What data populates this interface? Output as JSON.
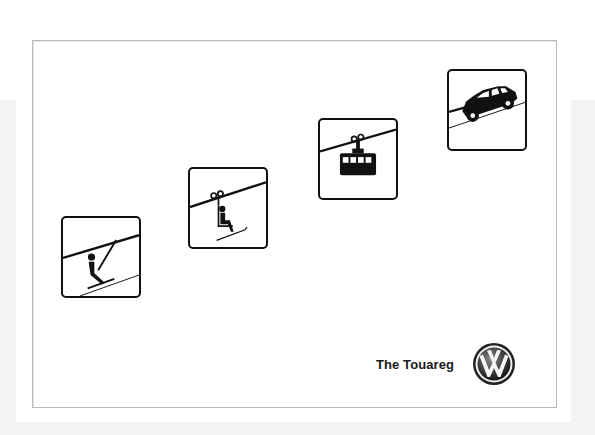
{
  "ad": {
    "tagline": "The Touareg",
    "brand_logo": "volkswagen-logo",
    "colors": {
      "background": "#ffffff",
      "outer_band": "#f3f3f3",
      "frame_border": "#b9b9b9",
      "ink": "#111111"
    },
    "signs": [
      {
        "id": "surface-lift",
        "icon": "t-bar-surface-lift-icon"
      },
      {
        "id": "chairlift",
        "icon": "chairlift-icon"
      },
      {
        "id": "gondola",
        "icon": "gondola-cable-car-icon"
      },
      {
        "id": "suv-hill",
        "icon": "suv-climbing-hill-icon"
      }
    ]
  }
}
